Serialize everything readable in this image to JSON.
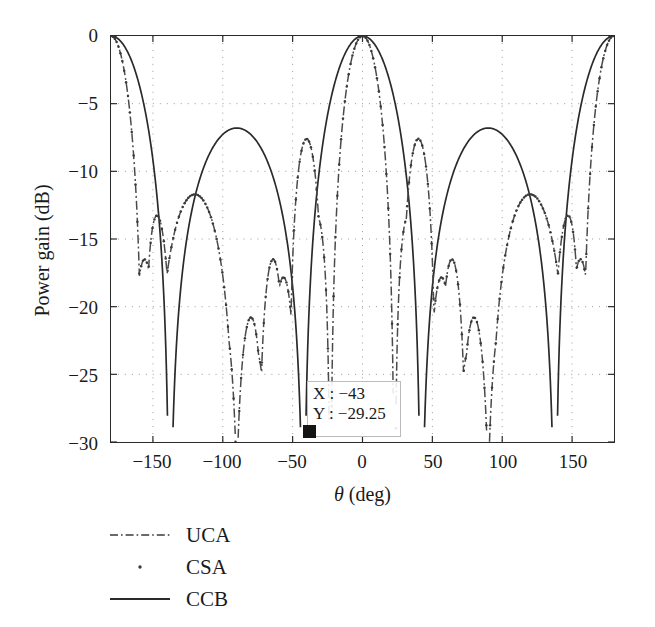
{
  "chart_data": {
    "type": "line",
    "title": "",
    "subtitle": "",
    "xlabel": "θ (deg)",
    "ylabel": "Power gain (dB)",
    "xlim": [
      -180,
      180
    ],
    "ylim": [
      -30,
      0
    ],
    "xticks": [
      -150,
      -100,
      -50,
      0,
      50,
      100,
      150
    ],
    "xtick_labels": [
      "−150",
      "−100",
      "−50",
      "0",
      "50",
      "100",
      "150"
    ],
    "yticks": [
      0,
      -5,
      -10,
      -15,
      -20,
      -25,
      -30
    ],
    "ytick_labels": [
      "0",
      "−5",
      "−10",
      "−15",
      "−20",
      "−25",
      "−30"
    ],
    "grid": true,
    "grid_style": "dotted",
    "legend_position": "below-left",
    "series": [
      {
        "name": "UCA",
        "style": "dash-dot",
        "color": "#3a3a3a",
        "main_lobes_deg": [
          -180,
          0,
          180
        ],
        "main_lobe_halfwidth_deg": 21,
        "sidelobe_peaks_deg": [
          -156,
          -120,
          -64,
          -40,
          40,
          64,
          120,
          156
        ],
        "sidelobe_peak_db": [
          -16.5,
          -11.7,
          -16.5,
          -7.6,
          -7.6,
          -16.5,
          -11.7,
          -16.5
        ],
        "notes": "narrow main lobe, dash-dot line overlapping CSA"
      },
      {
        "name": "CSA",
        "style": "dotted",
        "color": "#3a3a3a",
        "main_lobes_deg": [
          -180,
          0,
          180
        ],
        "main_lobe_halfwidth_deg": 21,
        "sidelobe_peaks_deg": [
          -156,
          -120,
          -64,
          -40,
          40,
          64,
          120,
          156
        ],
        "sidelobe_peak_db": [
          -16.5,
          -11.7,
          -16.5,
          -7.6,
          -7.6,
          -16.5,
          -11.7,
          -16.5
        ],
        "notes": "dotted markers coincident with UCA"
      },
      {
        "name": "CCB",
        "style": "solid",
        "color": "#2a2a2a",
        "main_lobes_deg": [
          -180,
          0,
          180
        ],
        "main_lobe_halfwidth_deg": 38,
        "sidelobe_peaks_deg": [
          -90,
          90
        ],
        "sidelobe_peak_db": [
          -6.8,
          -6.8
        ],
        "nulls_deg": [
          -138,
          -42,
          42,
          138
        ],
        "notes": "solid line, wide lobes"
      }
    ],
    "annotation": {
      "label_x": "X : −43",
      "label_y": "Y : −29.25",
      "x_value": -43,
      "y_value": -29.25,
      "marker": "square",
      "marker_color": "#141414"
    }
  },
  "legend": {
    "items": [
      {
        "label": "UCA",
        "style": "dash-dot"
      },
      {
        "label": "CSA",
        "style": "dotted"
      },
      {
        "label": "CCB",
        "style": "solid"
      }
    ]
  },
  "axes": {
    "x_title": "θ (deg)",
    "x_title_symbol": "θ",
    "x_title_unit": " (deg)",
    "y_title": "Power gain (dB)"
  }
}
